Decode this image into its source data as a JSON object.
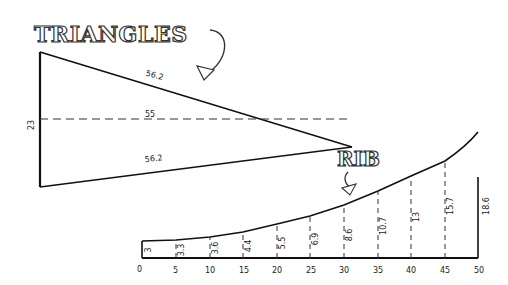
{
  "triangles": {
    "title": "TRIANGLES",
    "height_label": "23",
    "top_side_label": "56.2",
    "center_label": "55",
    "bottom_side_label": "56.2"
  },
  "rib": {
    "title": "RIB",
    "x_ticks": [
      "0",
      "5",
      "10",
      "15",
      "20",
      "25",
      "30",
      "35",
      "40",
      "45",
      "50"
    ],
    "heights": [
      "3",
      "3.3",
      "3.6",
      "4.4",
      "5.5",
      "6.9",
      "8.6",
      "10.7",
      "13",
      "15.7",
      "18.6"
    ]
  },
  "colors": {
    "ink": "#222222",
    "background": "#ffffff"
  }
}
